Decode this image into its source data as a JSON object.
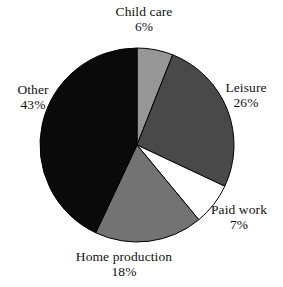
{
  "chart_data": {
    "type": "pie",
    "title": "",
    "subtitle": "",
    "xlabel": "",
    "ylabel": "",
    "legend_position": "none",
    "labels_position": "outside",
    "grid": false,
    "start_angle_deg": 0,
    "direction": "clockwise",
    "units": "percent",
    "categories": [
      "Child care",
      "Leisure",
      "Paid work",
      "Home production",
      "Other"
    ],
    "values": [
      6,
      26,
      7,
      18,
      43
    ],
    "value_labels": [
      "6%",
      "26%",
      "7%",
      "18%",
      "43%"
    ],
    "colors": [
      "#969696",
      "#494949",
      "#ffffff",
      "#737373",
      "#0a0a0a"
    ],
    "slice_outline_color": "#000000",
    "background_color": "#ffffff",
    "text_color": "#111111",
    "slices": [
      {
        "name": "Child care",
        "value": 6,
        "value_label": "6%",
        "color": "#969696"
      },
      {
        "name": "Leisure",
        "value": 26,
        "value_label": "26%",
        "color": "#494949"
      },
      {
        "name": "Paid work",
        "value": 7,
        "value_label": "7%",
        "color": "#ffffff"
      },
      {
        "name": "Home production",
        "value": 18,
        "value_label": "18%",
        "color": "#737373"
      },
      {
        "name": "Other",
        "value": 43,
        "value_label": "43%",
        "color": "#0a0a0a"
      }
    ]
  },
  "geometry": {
    "center_x": 137,
    "center_y": 145,
    "radius": 97
  }
}
